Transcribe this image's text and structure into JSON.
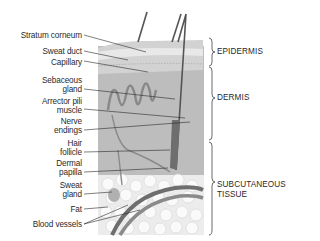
{
  "diagram": {
    "left_labels": [
      {
        "id": "stratum-corneum",
        "lines": [
          "Stratum corneum"
        ]
      },
      {
        "id": "sweat-duct",
        "lines": [
          "Sweat duct"
        ]
      },
      {
        "id": "capillary",
        "lines": [
          "Capillary"
        ]
      },
      {
        "id": "sebaceous-gland",
        "lines": [
          "Sebaceous",
          "gland"
        ]
      },
      {
        "id": "arrector-pili-muscle",
        "lines": [
          "Arrector pili",
          "muscle"
        ]
      },
      {
        "id": "nerve-endings",
        "lines": [
          "Nerve",
          "endings"
        ]
      },
      {
        "id": "hair-follicle",
        "lines": [
          "Hair",
          "follicle"
        ]
      },
      {
        "id": "dermal-papilla",
        "lines": [
          "Dermal",
          "papilla"
        ]
      },
      {
        "id": "sweat-gland",
        "lines": [
          "Sweat",
          "gland"
        ]
      },
      {
        "id": "fat",
        "lines": [
          "Fat"
        ]
      },
      {
        "id": "blood-vessels",
        "lines": [
          "Blood vessels"
        ]
      }
    ],
    "layers": [
      {
        "id": "epidermis",
        "lines": [
          "EPIDERMIS"
        ]
      },
      {
        "id": "dermis",
        "lines": [
          "DERMIS"
        ]
      },
      {
        "id": "subcutaneous-tissue",
        "lines": [
          "SUBCUTANEOUS",
          "TISSUE"
        ]
      }
    ],
    "colors": {
      "skin_top": "#cfcfcf",
      "dermis": "#b9b9b9",
      "fat": "#f2f2f2",
      "vessel": "#6e6e6e",
      "hair": "#555555",
      "text": "#2a2a2a"
    }
  }
}
